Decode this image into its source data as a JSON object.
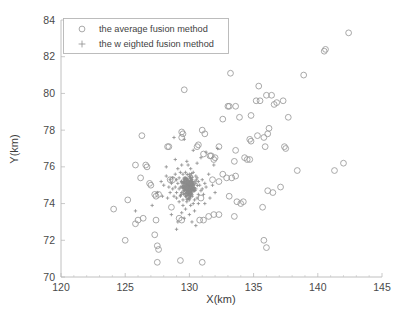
{
  "chart_data": {
    "type": "scatter",
    "title": "",
    "xlabel": "X(km)",
    "ylabel": "Y(km)",
    "xlim": [
      120,
      145
    ],
    "ylim": [
      70,
      84
    ],
    "xticks": [
      120,
      125,
      130,
      135,
      140,
      145
    ],
    "yticks": [
      70,
      72,
      74,
      76,
      78,
      80,
      82,
      84
    ],
    "xtick_labels": [
      "120",
      "125",
      "130",
      "135",
      "140",
      "145"
    ],
    "ytick_labels": [
      "70",
      "72",
      "74",
      "76",
      "78",
      "80",
      "82",
      "84"
    ],
    "grid": false,
    "legend_position": "top-left-inside",
    "legend": [
      {
        "label": "the average fusion method",
        "marker": "circle",
        "color": "#9a9a9a"
      },
      {
        "label": "the w eighted fusion method",
        "marker": "plus",
        "color": "#8d8d8d"
      }
    ],
    "series": [
      {
        "name": "the average fusion method",
        "marker": "circle",
        "color": "#9a9a9a",
        "points": [
          [
            142.4,
            83.3
          ],
          [
            140.6,
            82.4
          ],
          [
            140.5,
            82.3
          ],
          [
            133.2,
            81.1
          ],
          [
            138.9,
            81.0
          ],
          [
            129.6,
            80.2
          ],
          [
            135.4,
            80.4
          ],
          [
            136.4,
            79.9
          ],
          [
            136.0,
            79.9
          ],
          [
            135.2,
            79.6
          ],
          [
            135.5,
            79.6
          ],
          [
            136.6,
            79.4
          ],
          [
            136.8,
            79.5
          ],
          [
            137.3,
            79.6
          ],
          [
            133.1,
            79.3
          ],
          [
            133.0,
            79.3
          ],
          [
            133.6,
            79.3
          ],
          [
            133.9,
            78.7
          ],
          [
            132.6,
            78.6
          ],
          [
            134.8,
            78.8
          ],
          [
            137.7,
            78.7
          ],
          [
            136.2,
            78.1
          ],
          [
            131.0,
            78.0
          ],
          [
            129.4,
            77.9
          ],
          [
            129.5,
            77.8
          ],
          [
            129.4,
            77.6
          ],
          [
            126.3,
            77.7
          ],
          [
            131.2,
            77.8
          ],
          [
            136.1,
            77.8
          ],
          [
            135.8,
            77.6
          ],
          [
            135.3,
            77.7
          ],
          [
            134.8,
            77.4
          ],
          [
            134.7,
            77.5
          ],
          [
            128.3,
            77.1
          ],
          [
            128.4,
            77.1
          ],
          [
            130.7,
            77.2
          ],
          [
            130.6,
            77.1
          ],
          [
            132.3,
            77.1
          ],
          [
            133.6,
            76.9
          ],
          [
            135.9,
            77.1
          ],
          [
            137.4,
            77.1
          ],
          [
            137.5,
            77.0
          ],
          [
            131.1,
            76.7
          ],
          [
            131.6,
            76.6
          ],
          [
            131.7,
            76.6
          ],
          [
            132.0,
            76.5
          ],
          [
            131.9,
            76.4
          ],
          [
            134.3,
            76.5
          ],
          [
            134.5,
            76.4
          ],
          [
            134.7,
            76.4
          ],
          [
            133.5,
            76.3
          ],
          [
            125.8,
            76.1
          ],
          [
            126.6,
            76.1
          ],
          [
            126.7,
            76.0
          ],
          [
            138.4,
            75.8
          ],
          [
            141.3,
            75.8
          ],
          [
            142.0,
            76.2
          ],
          [
            132.6,
            75.6
          ],
          [
            132.9,
            75.4
          ],
          [
            133.3,
            75.4
          ],
          [
            133.6,
            75.5
          ],
          [
            131.8,
            75.3
          ],
          [
            132.3,
            75.2
          ],
          [
            126.2,
            75.4
          ],
          [
            128.5,
            75.3
          ],
          [
            128.7,
            75.3
          ],
          [
            126.9,
            75.1
          ],
          [
            127.0,
            75.0
          ],
          [
            137.1,
            74.9
          ],
          [
            136.5,
            74.6
          ],
          [
            136.1,
            74.7
          ],
          [
            127.3,
            74.5
          ],
          [
            127.4,
            74.4
          ],
          [
            127.6,
            74.5
          ],
          [
            130.9,
            74.3
          ],
          [
            133.1,
            74.4
          ],
          [
            133.7,
            74.1
          ],
          [
            134.2,
            74.1
          ],
          [
            134.0,
            74.0
          ],
          [
            125.2,
            74.2
          ],
          [
            135.7,
            73.8
          ],
          [
            128.6,
            73.8
          ],
          [
            124.1,
            73.7
          ],
          [
            126.4,
            73.2
          ],
          [
            126.0,
            73.1
          ],
          [
            125.8,
            72.9
          ],
          [
            127.4,
            73.1
          ],
          [
            129.2,
            73.2
          ],
          [
            129.4,
            73.1
          ],
          [
            130.8,
            73.1
          ],
          [
            131.1,
            73.1
          ],
          [
            131.5,
            73.3
          ],
          [
            131.9,
            73.4
          ],
          [
            132.3,
            73.4
          ],
          [
            133.5,
            73.3
          ],
          [
            135.8,
            72.0
          ],
          [
            136.0,
            71.6
          ],
          [
            127.3,
            72.3
          ],
          [
            125.0,
            72.0
          ],
          [
            127.5,
            71.7
          ],
          [
            127.6,
            71.5
          ],
          [
            127.5,
            70.8
          ],
          [
            129.3,
            70.9
          ],
          [
            131.0,
            70.8
          ]
        ]
      },
      {
        "name": "the w eighted fusion method",
        "marker": "plus",
        "color": "#8d8d8d",
        "cluster_center": [
          129.9,
          74.9
        ],
        "cluster_spread": [
          0.55,
          0.55
        ],
        "points": [
          [
            129.4,
            76.1
          ],
          [
            129.9,
            76.1
          ],
          [
            129.1,
            75.9
          ],
          [
            130.1,
            75.9
          ],
          [
            129.3,
            75.7
          ],
          [
            129.7,
            75.7
          ],
          [
            130.3,
            75.7
          ],
          [
            128.9,
            75.6
          ],
          [
            129.5,
            75.6
          ],
          [
            130.0,
            75.6
          ],
          [
            130.5,
            75.5
          ],
          [
            128.7,
            75.4
          ],
          [
            129.2,
            75.4
          ],
          [
            129.6,
            75.4
          ],
          [
            130.1,
            75.4
          ],
          [
            130.6,
            75.4
          ],
          [
            131.0,
            75.3
          ],
          [
            128.5,
            75.3
          ],
          [
            129.0,
            75.3
          ],
          [
            129.4,
            75.2
          ],
          [
            129.8,
            75.2
          ],
          [
            130.2,
            75.2
          ],
          [
            130.7,
            75.2
          ],
          [
            131.2,
            75.1
          ],
          [
            128.6,
            75.1
          ],
          [
            129.1,
            75.1
          ],
          [
            129.5,
            75.0
          ],
          [
            129.9,
            75.0
          ],
          [
            130.3,
            75.0
          ],
          [
            130.8,
            75.0
          ],
          [
            131.3,
            74.9
          ],
          [
            128.4,
            74.9
          ],
          [
            128.9,
            74.9
          ],
          [
            129.3,
            74.9
          ],
          [
            129.7,
            74.9
          ],
          [
            130.1,
            74.9
          ],
          [
            130.5,
            74.8
          ],
          [
            131.0,
            74.8
          ],
          [
            128.7,
            74.8
          ],
          [
            129.2,
            74.8
          ],
          [
            129.6,
            74.7
          ],
          [
            130.0,
            74.7
          ],
          [
            130.4,
            74.7
          ],
          [
            130.9,
            74.7
          ],
          [
            128.5,
            74.6
          ],
          [
            129.0,
            74.6
          ],
          [
            129.4,
            74.6
          ],
          [
            129.8,
            74.6
          ],
          [
            130.2,
            74.5
          ],
          [
            130.7,
            74.5
          ],
          [
            131.1,
            74.5
          ],
          [
            128.8,
            74.4
          ],
          [
            129.3,
            74.4
          ],
          [
            129.7,
            74.4
          ],
          [
            130.1,
            74.4
          ],
          [
            130.6,
            74.3
          ],
          [
            129.0,
            74.3
          ],
          [
            129.5,
            74.2
          ],
          [
            130.0,
            74.2
          ],
          [
            130.4,
            74.2
          ],
          [
            129.2,
            74.1
          ],
          [
            129.8,
            74.1
          ],
          [
            130.3,
            74.0
          ],
          [
            129.5,
            73.9
          ],
          [
            130.1,
            73.9
          ],
          [
            130.7,
            74.0
          ],
          [
            131.2,
            74.0
          ],
          [
            129.7,
            73.7
          ],
          [
            130.4,
            73.6
          ],
          [
            129.4,
            73.5
          ],
          [
            130.0,
            73.4
          ],
          [
            129.6,
            73.2
          ],
          [
            130.2,
            73.0
          ],
          [
            129.1,
            73.0
          ],
          [
            128.6,
            73.4
          ],
          [
            128.3,
            74.3
          ],
          [
            127.9,
            74.4
          ],
          [
            127.5,
            74.6
          ],
          [
            128.0,
            75.0
          ],
          [
            128.2,
            75.5
          ],
          [
            131.5,
            75.6
          ],
          [
            131.8,
            75.0
          ],
          [
            131.6,
            74.3
          ],
          [
            132.0,
            74.6
          ],
          [
            125.8,
            73.6
          ],
          [
            127.1,
            73.9
          ],
          [
            128.8,
            77.6
          ],
          [
            129.6,
            77.5
          ],
          [
            130.9,
            76.5
          ],
          [
            132.2,
            77.0
          ],
          [
            130.3,
            76.9
          ],
          [
            129.8,
            76.3
          ],
          [
            128.9,
            76.4
          ],
          [
            130.6,
            76.2
          ],
          [
            131.3,
            76.8
          ],
          [
            128.2,
            76.0
          ],
          [
            127.8,
            75.2
          ],
          [
            131.9,
            76.1
          ],
          [
            129.0,
            72.6
          ],
          [
            130.5,
            72.8
          ]
        ]
      }
    ]
  },
  "axes": {
    "x_title": "X(km)",
    "y_title": "Y(km)"
  }
}
